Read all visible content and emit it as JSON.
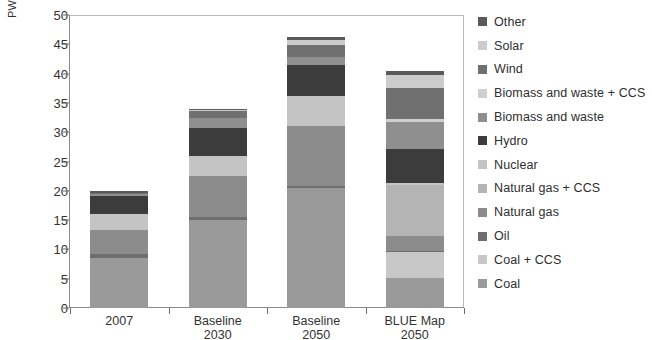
{
  "chart_data": {
    "type": "bar",
    "stacked": true,
    "title": "",
    "subtitle": "",
    "xlabel": "",
    "ylabel": "PWh",
    "ylim": [
      0,
      50
    ],
    "yticks": [
      0,
      5,
      10,
      15,
      20,
      25,
      30,
      35,
      40,
      45,
      50
    ],
    "ytick_labels": [
      "0",
      "5",
      "10",
      "15",
      "20",
      "25",
      "30",
      "35",
      "40",
      "45",
      "50"
    ],
    "grid": false,
    "legend_position": "right",
    "categories": [
      "2007",
      "Baseline\n2030",
      "Baseline\n2050",
      "BLUE Map\n2050"
    ],
    "category_labels": [
      "2007",
      "Baseline 2030",
      "Baseline 2050",
      "BLUE Map 2050"
    ],
    "totals": [
      20.0,
      34.0,
      46.2,
      40.4
    ],
    "series": [
      {
        "name": "Coal",
        "color": "#9a9a9a",
        "values": [
          8.6,
          15.1,
          20.5,
          5.2
        ]
      },
      {
        "name": "Coal + CCS",
        "color": "#c8c8c8",
        "values": [
          0.0,
          0.0,
          0.0,
          4.3
        ]
      },
      {
        "name": "Oil",
        "color": "#6e6e6e",
        "values": [
          0.7,
          0.4,
          0.3,
          0.2
        ]
      },
      {
        "name": "Natural gas",
        "color": "#8c8c8c",
        "values": [
          4.0,
          7.1,
          10.2,
          2.6
        ]
      },
      {
        "name": "Natural gas + CCS",
        "color": "#b4b4b4",
        "values": [
          0.0,
          0.0,
          0.0,
          8.7
        ]
      },
      {
        "name": "Nuclear",
        "color": "#c4c4c4",
        "values": [
          2.7,
          3.4,
          5.1,
          0.3
        ]
      },
      {
        "name": "Hydro",
        "color": "#3c3c3c",
        "values": [
          3.1,
          4.7,
          5.3,
          5.8
        ]
      },
      {
        "name": "Biomass and waste",
        "color": "#8f8f8f",
        "values": [
          0.3,
          1.8,
          1.5,
          4.7
        ]
      },
      {
        "name": "Biomass and waste + CCS",
        "color": "#cfcfcf",
        "values": [
          0.0,
          0.0,
          0.0,
          0.5
        ]
      },
      {
        "name": "Wind",
        "color": "#707070",
        "values": [
          0.2,
          1.2,
          2.0,
          5.2
        ]
      },
      {
        "name": "Solar",
        "color": "#cccccc",
        "values": [
          0.0,
          0.2,
          0.9,
          2.3
        ]
      },
      {
        "name": "Other",
        "color": "#5a5a5a",
        "values": [
          0.4,
          0.1,
          0.4,
          0.6
        ]
      }
    ]
  },
  "legend": {
    "items": [
      {
        "label": "Other",
        "color": "#5a5a5a"
      },
      {
        "label": "Solar",
        "color": "#cccccc"
      },
      {
        "label": "Wind",
        "color": "#707070"
      },
      {
        "label": "Biomass and waste + CCS",
        "color": "#cfcfcf"
      },
      {
        "label": "Biomass and waste",
        "color": "#8f8f8f"
      },
      {
        "label": "Hydro",
        "color": "#3c3c3c"
      },
      {
        "label": "Nuclear",
        "color": "#c4c4c4"
      },
      {
        "label": "Natural gas + CCS",
        "color": "#b4b4b4"
      },
      {
        "label": "Natural gas",
        "color": "#8c8c8c"
      },
      {
        "label": "Oil",
        "color": "#6e6e6e"
      },
      {
        "label": "Coal + CCS",
        "color": "#c8c8c8"
      },
      {
        "label": "Coal",
        "color": "#9a9a9a"
      }
    ]
  },
  "axis": {
    "y_title": "PWh"
  }
}
